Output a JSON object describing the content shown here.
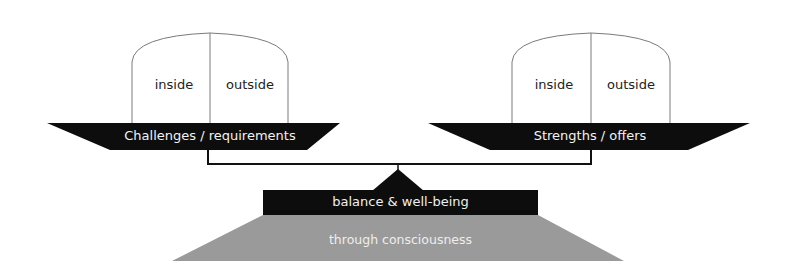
{
  "diagram": {
    "type": "balance-scale",
    "left_pan": {
      "label": "Challenges / requirements",
      "bucket": {
        "left_label": "inside",
        "right_label": "outside"
      }
    },
    "right_pan": {
      "label": "Strengths / offers",
      "bucket": {
        "left_label": "inside",
        "right_label": "outside"
      }
    },
    "fulcrum": {
      "label": "balance & well-being"
    },
    "base": {
      "label": "through consciousness"
    },
    "colors": {
      "tray": "#0d0d0d",
      "base": "#9a9a9a",
      "outline": "#808080",
      "beam": "#111111"
    }
  }
}
